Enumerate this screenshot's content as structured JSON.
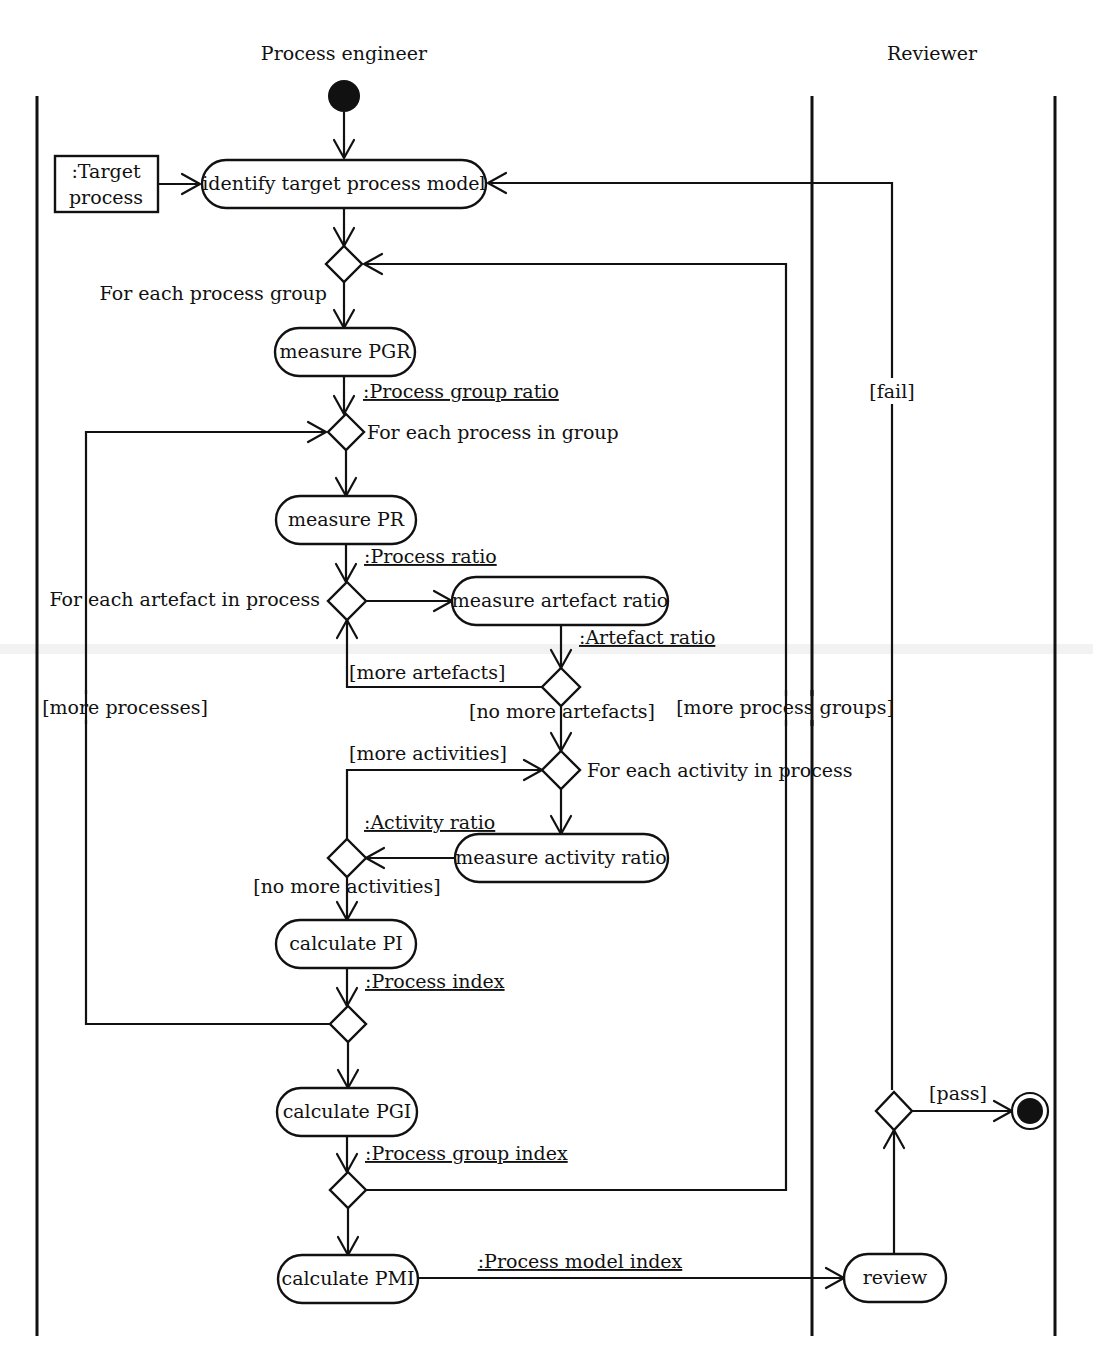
{
  "swimlanes": [
    {
      "name": "Process engineer"
    },
    {
      "name": "Reviewer"
    }
  ],
  "objects": {
    "target_process_line1": ":Target",
    "target_process_line2": "process"
  },
  "actions": {
    "identify": "identify target process model",
    "measure_pgr": "measure PGR",
    "measure_pr": "measure PR",
    "measure_artefact": "measure artefact ratio",
    "measure_activity": "measure activity ratio",
    "calc_pi": "calculate PI",
    "calc_pgi": "calculate PGI",
    "calc_pmi": "calculate PMI",
    "review": "review"
  },
  "object_flows": {
    "pgr": ":Process group ratio",
    "pr": ":Process ratio",
    "artefact": ":Artefact ratio",
    "activity": ":Activity ratio",
    "pi": ":Process index",
    "pgi": ":Process group index",
    "pmi": ":Process model index"
  },
  "loop_labels": {
    "each_group": "For each process group",
    "each_process": "For each process in group",
    "each_artefact": "For each artefact in process",
    "each_activity": "For each activity in process"
  },
  "guards": {
    "more_artefacts": "[more artefacts]",
    "no_more_artefacts": "[no more artefacts]",
    "more_activities": "[more activities]",
    "no_more_activities": "[no more activities]",
    "more_processes": "[more processes]",
    "more_groups": "[more process groups]",
    "fail": "[fail]",
    "pass": "[pass]"
  }
}
